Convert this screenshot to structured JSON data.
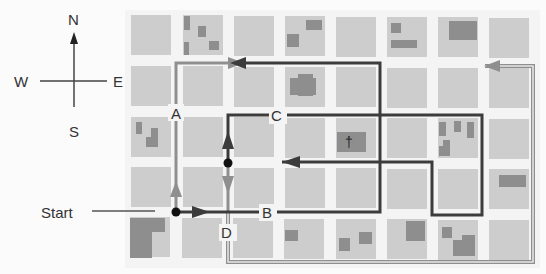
{
  "compass": {
    "north": "N",
    "south": "S",
    "east": "E",
    "west": "W"
  },
  "start_label": "Start",
  "points": [
    {
      "id": "A",
      "label": "A",
      "x": 176,
      "y": 113
    },
    {
      "id": "B",
      "label": "B",
      "x": 268,
      "y": 212
    },
    {
      "id": "C",
      "label": "C",
      "x": 278,
      "y": 115
    },
    {
      "id": "D",
      "label": "D",
      "x": 228,
      "y": 232
    }
  ],
  "church_symbol": "†",
  "colors": {
    "block": "#cdcdcd",
    "building": "#8c8c8c",
    "street": "#f6f6f6",
    "route_dark": "#3c3c3c",
    "route_gray": "#8f8f8f",
    "text": "#333333"
  },
  "grid": {
    "columns": 8,
    "rows": 5
  }
}
